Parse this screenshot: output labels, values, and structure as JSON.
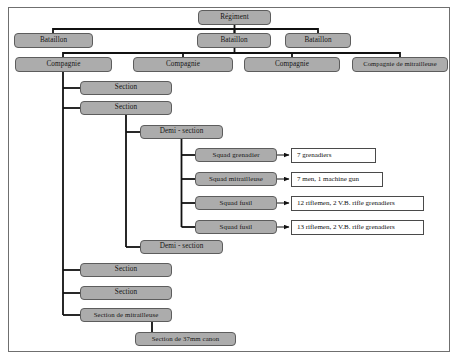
{
  "diagram": {
    "colors": {
      "node_fill": "#acacac",
      "node_border": "#5d5d5d",
      "leaf_fill": "#ffffff",
      "leaf_border": "#4a4a4a",
      "connector": "#111111",
      "frame_border": "#6f6f6f",
      "background": "#ffffff"
    },
    "nodes": [
      {
        "id": "regiment",
        "label": "Régiment",
        "x": 198,
        "y": 10,
        "w": 73,
        "h": 15,
        "font": 7.2
      },
      {
        "id": "bataillon-1",
        "label": "Bataillon",
        "x": 14,
        "y": 33,
        "w": 79,
        "h": 15,
        "font": 7.2
      },
      {
        "id": "bataillon-2",
        "label": "Bataillon",
        "x": 197,
        "y": 33,
        "w": 74,
        "h": 15,
        "font": 7.2
      },
      {
        "id": "bataillon-3",
        "label": "Bataillon",
        "x": 285,
        "y": 33,
        "w": 66,
        "h": 15,
        "font": 7.2
      },
      {
        "id": "compagnie-1",
        "label": "Compagnie",
        "x": 15,
        "y": 57,
        "w": 97,
        "h": 15,
        "font": 7.2
      },
      {
        "id": "compagnie-2",
        "label": "Compagnie",
        "x": 133,
        "y": 57,
        "w": 100,
        "h": 15,
        "font": 7.2
      },
      {
        "id": "compagnie-3",
        "label": "Compagnie",
        "x": 244,
        "y": 57,
        "w": 96,
        "h": 15,
        "font": 7.2
      },
      {
        "id": "compagnie-mitr",
        "label": "Compagnie de mitrailleuse",
        "x": 352,
        "y": 57,
        "w": 96,
        "h": 15,
        "font": 6.6
      },
      {
        "id": "section-1",
        "label": "Section",
        "x": 80,
        "y": 81,
        "w": 92,
        "h": 14,
        "font": 7.2
      },
      {
        "id": "section-2",
        "label": "Section",
        "x": 80,
        "y": 101,
        "w": 92,
        "h": 14,
        "font": 7.2
      },
      {
        "id": "demi-section-1",
        "label": "Demi - section",
        "x": 140,
        "y": 125,
        "w": 83,
        "h": 14,
        "font": 7.2
      },
      {
        "id": "squad-grenadier",
        "label": "Squad grenadier",
        "x": 195,
        "y": 148,
        "w": 82,
        "h": 14,
        "font": 7.0
      },
      {
        "id": "squad-mitrailleuse",
        "label": "Squad mitrailleuse",
        "x": 195,
        "y": 172,
        "w": 82,
        "h": 14,
        "font": 7.0
      },
      {
        "id": "squad-fusil-1",
        "label": "Squad fusil",
        "x": 195,
        "y": 196,
        "w": 82,
        "h": 14,
        "font": 7.0
      },
      {
        "id": "squad-fusil-2",
        "label": "Squad fusil",
        "x": 195,
        "y": 220,
        "w": 82,
        "h": 14,
        "font": 7.0
      },
      {
        "id": "demi-section-2",
        "label": "Demi - section",
        "x": 140,
        "y": 240,
        "w": 83,
        "h": 14,
        "font": 7.2
      },
      {
        "id": "section-3",
        "label": "Section",
        "x": 80,
        "y": 263,
        "w": 92,
        "h": 14,
        "font": 7.2
      },
      {
        "id": "section-4",
        "label": "Section",
        "x": 80,
        "y": 286,
        "w": 92,
        "h": 14,
        "font": 7.2
      },
      {
        "id": "section-mitr",
        "label": "Section de mitrailleuse",
        "x": 80,
        "y": 308,
        "w": 92,
        "h": 14,
        "font": 6.8
      },
      {
        "id": "section-37mm",
        "label": "Section de 37mm canon",
        "x": 135,
        "y": 332,
        "w": 101,
        "h": 14,
        "font": 6.8
      }
    ],
    "leaves": [
      {
        "id": "leaf-grenadiers",
        "label": "7 grenadiers",
        "x": 291,
        "y": 148,
        "w": 85,
        "h": 15,
        "font": 7.0
      },
      {
        "id": "leaf-machine-gun",
        "label": "7 men, 1 machine gun",
        "x": 291,
        "y": 172,
        "w": 92,
        "h": 15,
        "font": 7.0
      },
      {
        "id": "leaf-riflemen-12",
        "label": "12 riflemen, 2 V.B. rifle grenadiers",
        "x": 291,
        "y": 196,
        "w": 133,
        "h": 15,
        "font": 7.0
      },
      {
        "id": "leaf-riflemen-13",
        "label": "13 riflemen, 2 V.B. rifle grenadiers",
        "x": 291,
        "y": 220,
        "w": 133,
        "h": 15,
        "font": 7.0
      }
    ],
    "connectors": {
      "regiment_to_bataillons": "Régiment drops to a horizontal bus feeding three Bataillon boxes",
      "bataillon_to_compagnies": "Bataillon 2 drops to a horizontal bus feeding four Compagnie boxes",
      "compagnie_spine": "Compagnie 1 drops a vertical spine with elbow branches to Sections and Section de mitrailleuse",
      "section_spine": "Section 2 drops a vertical spine with elbow branches to both Demi - section boxes",
      "demi_section_spine": "Demi - section 1 drops a vertical spine with elbow branches to the four Squad boxes",
      "squad_arrows": "Each Squad box connects rightwards with an arrowhead into its strength box",
      "mitrailleuse_branch": "Section de mitrailleuse drops an elbow to Section de 37mm canon"
    }
  }
}
